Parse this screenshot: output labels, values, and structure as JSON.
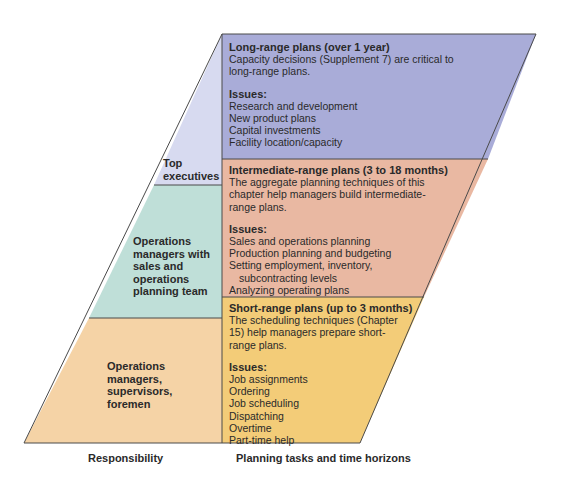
{
  "colors": {
    "top_left": "#d7daf0",
    "long_range": "#a9acd8",
    "middle_left": "#bfdfd8",
    "intermediate": "#e9b8a2",
    "bottom_left": "#f5d3a6",
    "short_range": "#f3cc78",
    "border": "#4a4a4a"
  },
  "responsibility": {
    "top": [
      "Top",
      "executives"
    ],
    "middle": [
      "Operations",
      "managers with",
      "sales and",
      "operations",
      "planning team"
    ],
    "bottom": [
      "Operations",
      "managers,",
      "supervisors,",
      "foremen"
    ]
  },
  "plans": {
    "long": {
      "title": "Long-range plans (over 1 year)",
      "desc": [
        "Capacity decisions (Supplement 7) are critical to",
        "long-range plans."
      ],
      "issues_label": "Issues:",
      "issues": [
        "Research and development",
        "New product plans",
        "Capital investments",
        "Facility location/capacity"
      ]
    },
    "intermediate": {
      "title": "Intermediate-range plans (3 to 18 months)",
      "desc": [
        "The aggregate planning techniques of this",
        "chapter help managers build intermediate-",
        "range plans."
      ],
      "issues_label": "Issues:",
      "issues": [
        "Sales and operations planning",
        "Production planning and budgeting",
        "Setting employment, inventory,",
        "subcontracting levels",
        "Analyzing operating plans"
      ]
    },
    "short": {
      "title": "Short-range plans (up to 3 months)",
      "desc": [
        "The scheduling techniques (Chapter",
        "15) help managers prepare short-",
        "range plans."
      ],
      "issues_label": "Issues:",
      "issues": [
        "Job assignments",
        "Ordering",
        "Job scheduling",
        "Dispatching",
        "Overtime",
        "Part-time help"
      ]
    }
  },
  "axis_labels": {
    "left": "Responsibility",
    "right": "Planning tasks and time horizons"
  }
}
